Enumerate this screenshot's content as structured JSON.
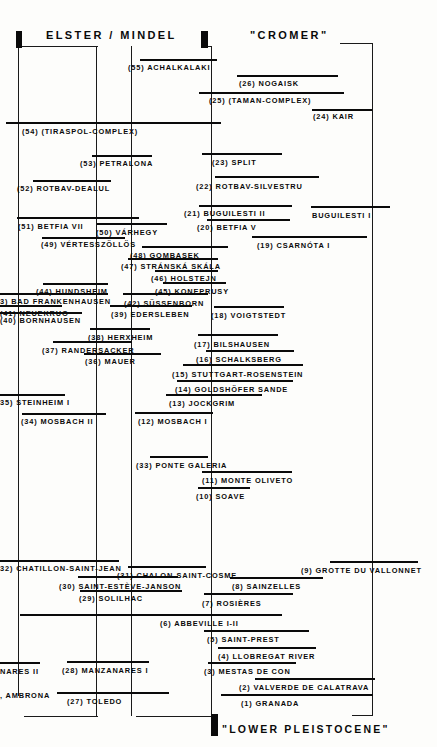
{
  "figure": {
    "type": "stratigraphic-correlation-chart",
    "headers": [
      {
        "text": "ELSTER  /  MINDEL",
        "x": 46,
        "y": 29
      },
      {
        "text": "\"CROMER\"",
        "x": 250,
        "y": 29
      }
    ],
    "footer": {
      "text": "\"LOWER  PLEISTOCENE\"",
      "x": 222,
      "y": 723
    },
    "blocks": [
      {
        "name": "elster-marker-left",
        "x": 16,
        "y": 31,
        "w": 6,
        "h": 17
      },
      {
        "name": "elster-marker-right",
        "x": 201,
        "y": 31,
        "w": 7,
        "h": 17
      },
      {
        "name": "lower-pleistocene-marker",
        "x": 211,
        "y": 714,
        "w": 7,
        "h": 22
      }
    ],
    "entries": [
      {
        "id": "55",
        "label": "(55) ACHALKALAKI",
        "bar_x": 140,
        "bar_w": 77,
        "bar_y": 59,
        "lbl_x": 128,
        "lbl_y": 64
      },
      {
        "id": "26",
        "label": "(26) NOGAISK",
        "bar_x": 237,
        "bar_w": 101,
        "bar_y": 75,
        "lbl_x": 239,
        "lbl_y": 80
      },
      {
        "id": "25",
        "label": "(25) (TAMAN-COMPLEX)",
        "bar_x": 199,
        "bar_w": 145,
        "bar_y": 92,
        "lbl_x": 209,
        "lbl_y": 97
      },
      {
        "id": "24",
        "label": "(24) KAIR",
        "bar_x": 312,
        "bar_w": 60,
        "bar_y": 109,
        "lbl_x": 313,
        "lbl_y": 113
      },
      {
        "id": "54",
        "label": "(54)  (TIRASPOL-COMPLEX)",
        "bar_x": 6,
        "bar_w": 215,
        "bar_y": 122,
        "lbl_x": 22,
        "lbl_y": 128
      },
      {
        "id": "53",
        "label": "(53) PETRALONA",
        "bar_x": 92,
        "bar_w": 60,
        "bar_y": 155,
        "lbl_x": 80,
        "lbl_y": 160
      },
      {
        "id": "23",
        "label": "(23) SPLIT",
        "bar_x": 202,
        "bar_w": 80,
        "bar_y": 153,
        "lbl_x": 212,
        "lbl_y": 159
      },
      {
        "id": "52",
        "label": "(52) ROTBAV-DEALUL",
        "bar_x": 33,
        "bar_w": 78,
        "bar_y": 180,
        "lbl_x": 17,
        "lbl_y": 185
      },
      {
        "id": "22",
        "label": "(22) ROTBAV-SILVESTRU",
        "bar_x": 215,
        "bar_w": 104,
        "bar_y": 176,
        "lbl_x": 196,
        "lbl_y": 183
      },
      {
        "id": "21",
        "label": "(21) BUGUILESTI II",
        "bar_x": 199,
        "bar_w": 93,
        "bar_y": 205,
        "lbl_x": 184,
        "lbl_y": 210
      },
      {
        "id": "bug1",
        "label": "BUGUILESTI I",
        "bar_x": 311,
        "bar_w": 79,
        "bar_y": 206,
        "lbl_x": 312,
        "lbl_y": 212
      },
      {
        "id": "51",
        "label": "(51) BETFIA VII",
        "bar_x": 17,
        "bar_w": 122,
        "bar_y": 217,
        "lbl_x": 18,
        "lbl_y": 223
      },
      {
        "id": "20",
        "label": "(20) BETFIA V",
        "bar_x": 207,
        "bar_w": 83,
        "bar_y": 219,
        "lbl_x": 197,
        "lbl_y": 224
      },
      {
        "id": "50",
        "label": "(50) VÁRHEGY",
        "bar_x": 97,
        "bar_w": 70,
        "bar_y": 223,
        "lbl_x": 96,
        "lbl_y": 229
      },
      {
        "id": "49",
        "label": "(49) VÉRTESSZÖLLÖS",
        "bar_x": 42,
        "bar_w": 83,
        "bar_y": 237,
        "lbl_x": 41,
        "lbl_y": 241
      },
      {
        "id": "19",
        "label": "(19)    CSARNÓTA I",
        "bar_x": 252,
        "bar_w": 115,
        "bar_y": 236,
        "lbl_x": 257,
        "lbl_y": 242
      },
      {
        "id": "48",
        "label": "(48) GOMBASEK",
        "bar_x": 142,
        "bar_w": 86,
        "bar_y": 246,
        "lbl_x": 130,
        "lbl_y": 252
      },
      {
        "id": "47",
        "label": "(47) STRÁNSKÁ SKÁLA",
        "bar_x": 128,
        "bar_w": 90,
        "bar_y": 258,
        "lbl_x": 121,
        "lbl_y": 263
      },
      {
        "id": "46",
        "label": "(46) HOLSTEJN",
        "bar_x": 155,
        "bar_w": 63,
        "bar_y": 270,
        "lbl_x": 151,
        "lbl_y": 275
      },
      {
        "id": "45",
        "label": "(45) KONEPRUSY",
        "bar_x": 163,
        "bar_w": 63,
        "bar_y": 282,
        "lbl_x": 155,
        "lbl_y": 288
      },
      {
        "id": "44",
        "label": "(44) HUNDSHEIM",
        "bar_x": 43,
        "bar_w": 65,
        "bar_y": 283,
        "lbl_x": 36,
        "lbl_y": 288
      },
      {
        "id": "43",
        "label": "3) BAD FRANKENHAUSEN",
        "bar_x": 0,
        "bar_w": 108,
        "bar_y": 293,
        "lbl_x": 0,
        "lbl_y": 298
      },
      {
        "id": "42",
        "label": "(42) SÜSSENBORN",
        "bar_x": 123,
        "bar_w": 85,
        "bar_y": 293,
        "lbl_x": 124,
        "lbl_y": 300
      },
      {
        "id": "41",
        "label": "(41) NEUEKRUG",
        "bar_x": 0,
        "bar_w": 62,
        "bar_y": 305,
        "lbl_x": 0,
        "lbl_y": 310
      },
      {
        "id": "39",
        "label": "(39) EDERSLEBEN",
        "bar_x": 110,
        "bar_w": 82,
        "bar_y": 305,
        "lbl_x": 111,
        "lbl_y": 311
      },
      {
        "id": "40",
        "label": "(40) BORNHAUSEN",
        "bar_x": 0,
        "bar_w": 82,
        "bar_y": 312,
        "lbl_x": 0,
        "lbl_y": 317
      },
      {
        "id": "18",
        "label": "(18) VOIGTSTEDT",
        "bar_x": 214,
        "bar_w": 70,
        "bar_y": 306,
        "lbl_x": 211,
        "lbl_y": 312
      },
      {
        "id": "38",
        "label": "(38) HERXHEIM",
        "bar_x": 90,
        "bar_w": 60,
        "bar_y": 328,
        "lbl_x": 88,
        "lbl_y": 334
      },
      {
        "id": "17",
        "label": "(17)   BILSHAUSEN",
        "bar_x": 198,
        "bar_w": 80,
        "bar_y": 334,
        "lbl_x": 194,
        "lbl_y": 341
      },
      {
        "id": "37",
        "label": "(37) RANDERSACKER",
        "bar_x": 53,
        "bar_w": 79,
        "bar_y": 341,
        "lbl_x": 42,
        "lbl_y": 347
      },
      {
        "id": "36",
        "label": "(36) MAUER",
        "bar_x": 84,
        "bar_w": 77,
        "bar_y": 353,
        "lbl_x": 85,
        "lbl_y": 358
      },
      {
        "id": "16",
        "label": "(16) SCHALKSBERG",
        "bar_x": 206,
        "bar_w": 88,
        "bar_y": 350,
        "lbl_x": 196,
        "lbl_y": 356
      },
      {
        "id": "15",
        "label": "(15)  STUTTGART-ROSENSTEIN",
        "bar_x": 183,
        "bar_w": 120,
        "bar_y": 364,
        "lbl_x": 172,
        "lbl_y": 371
      },
      {
        "id": "14",
        "label": "(14)  GOLDSHÖFER SANDE",
        "bar_x": 177,
        "bar_w": 116,
        "bar_y": 380,
        "lbl_x": 175,
        "lbl_y": 386
      },
      {
        "id": "13",
        "label": "(13)  JOCKGRIM",
        "bar_x": 166,
        "bar_w": 96,
        "bar_y": 394,
        "lbl_x": 169,
        "lbl_y": 400
      },
      {
        "id": "35",
        "label": "35) STEINHEIM I",
        "bar_x": 0,
        "bar_w": 65,
        "bar_y": 394,
        "lbl_x": 0,
        "lbl_y": 399
      },
      {
        "id": "34",
        "label": "(34) MOSBACH II",
        "bar_x": 22,
        "bar_w": 84,
        "bar_y": 413,
        "lbl_x": 21,
        "lbl_y": 418
      },
      {
        "id": "12",
        "label": "(12) MOSBACH I",
        "bar_x": 135,
        "bar_w": 78,
        "bar_y": 412,
        "lbl_x": 138,
        "lbl_y": 418
      },
      {
        "id": "33",
        "label": "(33) PONTE GALERIA",
        "bar_x": 150,
        "bar_w": 58,
        "bar_y": 456,
        "lbl_x": 136,
        "lbl_y": 462
      },
      {
        "id": "11",
        "label": "(11) MONTE OLIVETO",
        "bar_x": 202,
        "bar_w": 90,
        "bar_y": 471,
        "lbl_x": 202,
        "lbl_y": 477
      },
      {
        "id": "10",
        "label": "(10) SOAVE",
        "bar_x": 198,
        "bar_w": 52,
        "bar_y": 487,
        "lbl_x": 196,
        "lbl_y": 493
      },
      {
        "id": "32",
        "label": "32) CHATILLON-SAINT-JEAN",
        "bar_x": 0,
        "bar_w": 119,
        "bar_y": 560,
        "lbl_x": 0,
        "lbl_y": 565
      },
      {
        "id": "31",
        "label": "(31) CHALON-SAINT-COSME",
        "bar_x": 128,
        "bar_w": 78,
        "bar_y": 566,
        "lbl_x": 117,
        "lbl_y": 572
      },
      {
        "id": "9",
        "label": "(9)  GROTTE DU VALLONNET",
        "bar_x": 330,
        "bar_w": 88,
        "bar_y": 561,
        "lbl_x": 301,
        "lbl_y": 567
      },
      {
        "id": "30",
        "label": "(30) SAINT-ESTÈVE-JANSON",
        "bar_x": 78,
        "bar_w": 100,
        "bar_y": 576,
        "lbl_x": 59,
        "lbl_y": 583
      },
      {
        "id": "8",
        "label": "(8)  SAINZELLES",
        "bar_x": 230,
        "bar_w": 93,
        "bar_y": 577,
        "lbl_x": 232,
        "lbl_y": 583
      },
      {
        "id": "29",
        "label": "(29) SOLILHAC",
        "bar_x": 80,
        "bar_w": 102,
        "bar_y": 590,
        "lbl_x": 79,
        "lbl_y": 595
      },
      {
        "id": "7",
        "label": "(7)  ROSIÈRES",
        "bar_x": 204,
        "bar_w": 89,
        "bar_y": 593,
        "lbl_x": 202,
        "lbl_y": 600
      },
      {
        "id": "6",
        "label": "(6)  ABBEVILLE I-II",
        "bar_x": 20,
        "bar_w": 262,
        "bar_y": 614,
        "lbl_x": 160,
        "lbl_y": 620
      },
      {
        "id": "5",
        "label": "(5)  SAINT-PREST",
        "bar_x": 204,
        "bar_w": 105,
        "bar_y": 630,
        "lbl_x": 207,
        "lbl_y": 636
      },
      {
        "id": "4",
        "label": "(4)  LLOBREGAT RIVER",
        "bar_x": 218,
        "bar_w": 98,
        "bar_y": 647,
        "lbl_x": 218,
        "lbl_y": 653
      },
      {
        "id": "3",
        "label": "(3) MESTAS DE CON",
        "bar_x": 208,
        "bar_w": 88,
        "bar_y": 662,
        "lbl_x": 204,
        "lbl_y": 668
      },
      {
        "id": "manzanares2",
        "label": "NARES II",
        "bar_x": 0,
        "bar_w": 40,
        "bar_y": 662,
        "lbl_x": 0,
        "lbl_y": 668
      },
      {
        "id": "28",
        "label": "(28) MANZANARES I",
        "bar_x": 67,
        "bar_w": 82,
        "bar_y": 661,
        "lbl_x": 62,
        "lbl_y": 667
      },
      {
        "id": "2",
        "label": "(2) VALVERDE  DE CALATRAVA",
        "bar_x": 255,
        "bar_w": 120,
        "bar_y": 678,
        "lbl_x": 239,
        "lbl_y": 684
      },
      {
        "id": "ambrona",
        "label": ", AMBRONA",
        "bar_x": -1,
        "bar_w": 0,
        "bar_y": 0,
        "lbl_x": 0,
        "lbl_y": 692
      },
      {
        "id": "27",
        "label": "(27) TOLEDO",
        "bar_x": 57,
        "bar_w": 112,
        "bar_y": 692,
        "lbl_x": 67,
        "lbl_y": 698
      },
      {
        "id": "1",
        "label": "(1)    GRANADA",
        "bar_x": 221,
        "bar_w": 152,
        "bar_y": 694,
        "lbl_x": 241,
        "lbl_y": 700
      }
    ],
    "verticals": [
      {
        "x": 18,
        "y": 46,
        "h": 650
      },
      {
        "x": 96,
        "y": 46,
        "h": 670
      },
      {
        "x": 131,
        "y": 46,
        "h": 670
      },
      {
        "x": 211,
        "y": 46,
        "h": 668
      },
      {
        "x": 372,
        "y": 43,
        "h": 672
      },
      {
        "x": 96,
        "y": 131,
        "h": 26
      },
      {
        "x": 131,
        "y": 131,
        "h": 26
      }
    ],
    "connectors": [
      {
        "x": 18,
        "y": 46,
        "w": 80
      },
      {
        "x": 204,
        "y": 46,
        "w": 8
      },
      {
        "x": 340,
        "y": 43,
        "w": 33
      },
      {
        "x": 24,
        "y": 716,
        "w": 74
      },
      {
        "x": 136,
        "y": 716,
        "w": 78
      },
      {
        "x": 352,
        "y": 715,
        "w": 21
      }
    ]
  }
}
